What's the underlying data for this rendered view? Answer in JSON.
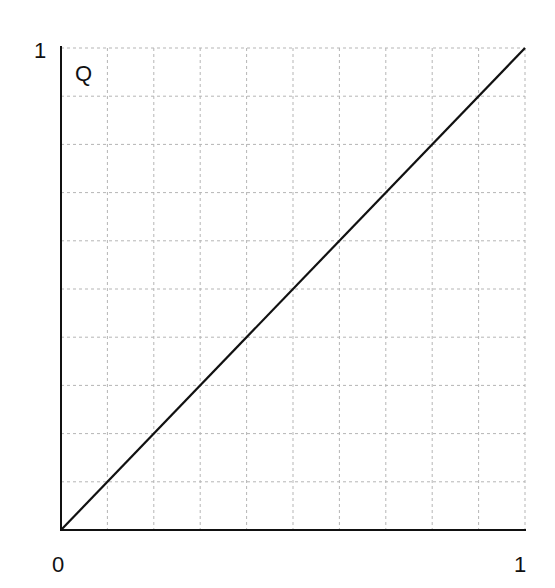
{
  "chart_data": {
    "type": "line",
    "title": "",
    "curve_label": "Q",
    "xlabel": "",
    "ylabel": "",
    "x_ticks": [
      "0",
      "1"
    ],
    "y_ticks": [
      "1"
    ],
    "xlim": [
      0,
      1
    ],
    "ylim": [
      0,
      1
    ],
    "grid": true,
    "grid_divisions": 10,
    "series": [
      {
        "name": "Q",
        "x": [
          0,
          1
        ],
        "y": [
          0,
          1
        ]
      }
    ]
  },
  "labels": {
    "origin": "0",
    "x_max": "1",
    "y_max": "1",
    "curve": "Q"
  },
  "colors": {
    "line": "#111111",
    "axis": "#111111",
    "grid": "#b5b5b5"
  }
}
